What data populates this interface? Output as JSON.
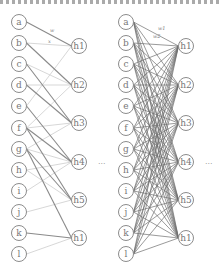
{
  "figure": {
    "cropped_top_text": "",
    "panels": [
      {
        "name": "sparse-network",
        "input_x": 19,
        "hidden_x": 79,
        "ellipsis_x": 98,
        "ellipsis": "...",
        "inputs": [
          {
            "label": "a",
            "y": 22
          },
          {
            "label": "b",
            "y": 43
          },
          {
            "label": "c",
            "y": 64
          },
          {
            "label": "d",
            "y": 85
          },
          {
            "label": "e",
            "y": 106
          },
          {
            "label": "f",
            "y": 128
          },
          {
            "label": "g",
            "y": 149
          },
          {
            "label": "h",
            "y": 170
          },
          {
            "label": "i",
            "y": 191
          },
          {
            "label": "j",
            "y": 212
          },
          {
            "label": "k",
            "y": 233
          },
          {
            "label": "l",
            "y": 254
          }
        ],
        "hidden": [
          {
            "label": "h1",
            "y": 46
          },
          {
            "label": "h2",
            "y": 85
          },
          {
            "label": "h3",
            "y": 123
          },
          {
            "label": "h4",
            "y": 162
          },
          {
            "label": "h5",
            "y": 200
          },
          {
            "label": "h1",
            "y": 238
          }
        ],
        "edge_labels": [
          {
            "text": "w",
            "x": 50,
            "y": 32
          },
          {
            "text": "x",
            "x": 48,
            "y": 43
          }
        ],
        "dark_edges": [
          [
            0,
            0
          ],
          [
            1,
            1
          ],
          [
            2,
            2
          ],
          [
            3,
            2
          ],
          [
            4,
            3
          ],
          [
            5,
            3
          ],
          [
            5,
            4
          ],
          [
            6,
            5
          ],
          [
            6,
            4
          ],
          [
            10,
            5
          ]
        ],
        "light_edges": [
          [
            1,
            0
          ],
          [
            2,
            1
          ],
          [
            3,
            1
          ],
          [
            4,
            0
          ],
          [
            5,
            2
          ],
          [
            5,
            1
          ],
          [
            6,
            3
          ],
          [
            7,
            4
          ],
          [
            8,
            3
          ],
          [
            9,
            4
          ],
          [
            11,
            5
          ],
          [
            6,
            2
          ],
          [
            7,
            3
          ]
        ],
        "colors": {
          "dark": "#8a8a8a",
          "light": "#d2d2d2",
          "node": "#8c8c8c"
        }
      },
      {
        "name": "dense-network",
        "input_x": 126,
        "hidden_x": 186,
        "ellipsis_x": 205,
        "ellipsis": "...",
        "inputs": [
          {
            "label": "a",
            "y": 22
          },
          {
            "label": "b",
            "y": 43
          },
          {
            "label": "c",
            "y": 64
          },
          {
            "label": "d",
            "y": 85
          },
          {
            "label": "e",
            "y": 106
          },
          {
            "label": "f",
            "y": 128
          },
          {
            "label": "g",
            "y": 149
          },
          {
            "label": "h",
            "y": 170
          },
          {
            "label": "i",
            "y": 191
          },
          {
            "label": "j",
            "y": 212
          },
          {
            "label": "k",
            "y": 233
          },
          {
            "label": "l",
            "y": 254
          }
        ],
        "hidden": [
          {
            "label": "h1",
            "y": 46
          },
          {
            "label": "h2",
            "y": 85
          },
          {
            "label": "h3",
            "y": 123
          },
          {
            "label": "h4",
            "y": 162
          },
          {
            "label": "h5",
            "y": 200
          },
          {
            "label": "h1",
            "y": 238
          }
        ],
        "edge_labels": [
          {
            "text": "w1",
            "x": 158,
            "y": 30
          },
          {
            "text": "w2",
            "x": 153,
            "y": 38
          }
        ],
        "fully_connected": true,
        "colors": {
          "edge": "#6e6e6e",
          "node": "#8c8c8c"
        }
      }
    ]
  }
}
